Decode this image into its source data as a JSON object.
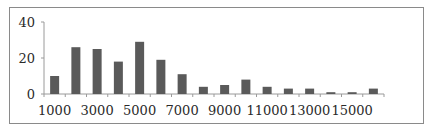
{
  "chart_data": {
    "type": "bar",
    "title": "",
    "xlabel": "",
    "ylabel": "",
    "categories": [
      "1000",
      "2000",
      "3000",
      "4000",
      "5000",
      "6000",
      "7000",
      "8000",
      "9000",
      "10000",
      "11000",
      "12000",
      "13000",
      "14000",
      "15000",
      "16000"
    ],
    "values": [
      10,
      26,
      25,
      18,
      29,
      19,
      11,
      4,
      5,
      8,
      4,
      3,
      3,
      1,
      1,
      3
    ],
    "x_tick_labels": [
      "1000",
      "3000",
      "5000",
      "7000",
      "9000",
      "11000",
      "13000",
      "15000"
    ],
    "y_tick_labels": [
      "0",
      "20",
      "40"
    ],
    "ylim": [
      0,
      40
    ],
    "grid": false,
    "legend": null,
    "bar_color": "#5a5a5a",
    "axis_color": "#9a9a9a"
  }
}
